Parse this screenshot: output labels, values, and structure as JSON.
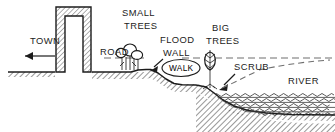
{
  "diagram": {
    "type": "cross-section",
    "colors": {
      "ink": "#1c1c1c",
      "hatch": "#4a4a4a",
      "paper": "#ffffff",
      "wall_fill": "#d9d9d9"
    },
    "labels": [
      {
        "key": "town",
        "text": "TOWN",
        "x": 30,
        "y": 44,
        "size": "normal"
      },
      {
        "key": "small_trees",
        "text": "SMALL",
        "x": 122,
        "y": 16,
        "size": "normal"
      },
      {
        "key": "small_trees2",
        "text": "TREES",
        "x": 124,
        "y": 29,
        "size": "normal"
      },
      {
        "key": "road",
        "text": "ROAD",
        "x": 100,
        "y": 55,
        "size": "normal"
      },
      {
        "key": "flood",
        "text": "FLOOD",
        "x": 160,
        "y": 43,
        "size": "normal"
      },
      {
        "key": "wall",
        "text": "WALL",
        "x": 163,
        "y": 56,
        "size": "normal"
      },
      {
        "key": "big_trees",
        "text": "BIG",
        "x": 212,
        "y": 31,
        "size": "normal"
      },
      {
        "key": "big_trees2",
        "text": "TREES",
        "x": 206,
        "y": 44,
        "size": "normal"
      },
      {
        "key": "walk",
        "text": "WALK",
        "x": 180,
        "y": 71,
        "size": "small"
      },
      {
        "key": "scrub",
        "text": "SCRUB",
        "x": 234,
        "y": 70,
        "size": "normal"
      },
      {
        "key": "river",
        "text": "RIVER",
        "x": 288,
        "y": 84,
        "size": "normal"
      }
    ],
    "features": {
      "town_arrow": "arrow-left",
      "flood_wall_arrow": "arrow-down-left",
      "scrub_arrow": "arrow-down-left",
      "flood_level_line": "dashed-horizontal",
      "scrub_leader": "dashed-curve",
      "water_ripples": "wavy-lines",
      "ground_fill": "diagonal-hatch",
      "structure": "arch-opening"
    }
  }
}
